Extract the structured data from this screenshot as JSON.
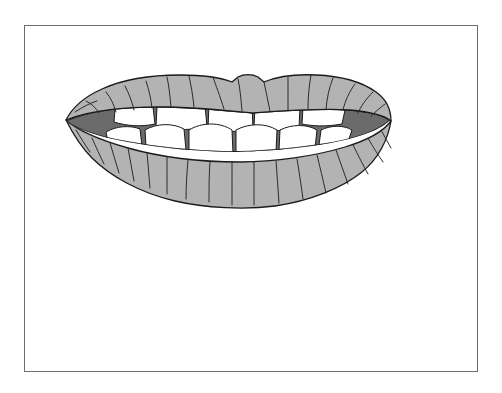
{
  "image": {
    "kind": "line-art-illustration",
    "subject": "lips-open-mouth-with-teeth",
    "alt_text": "Grayscale line drawing of a pair of parted lips showing upper and lower teeth",
    "canvas": {
      "width": 502,
      "height": 393
    },
    "background_color": "#ffffff"
  },
  "frame": {
    "name": "illustration-border",
    "x": 24,
    "y": 25,
    "width": 454,
    "height": 347,
    "stroke_color": "#6e6e6e",
    "stroke_width": 1,
    "fill_color": "#ffffff"
  },
  "palette": {
    "lip_fill": "#b3b3b3",
    "lip_outline": "#1a1a1a",
    "lip_crease": "#2b2b2b",
    "mouth_interior": "#6b6b6b",
    "tooth_fill": "#ffffff",
    "tooth_outline": "#1a1a1a",
    "paper": "#ffffff"
  },
  "drawing": {
    "name": "lips-drawing",
    "bounds": {
      "x": 65,
      "y": 74,
      "width": 326,
      "height": 136
    },
    "parts": [
      {
        "name": "upper-lip",
        "label": "Upper lip",
        "fill": "#b3b3b3"
      },
      {
        "name": "lower-lip",
        "label": "Lower lip",
        "fill": "#b3b3b3"
      },
      {
        "name": "mouth-interior",
        "label": "Mouth interior",
        "fill": "#6b6b6b"
      },
      {
        "name": "upper-teeth",
        "label": "Upper teeth",
        "fill": "#ffffff",
        "count": 4
      },
      {
        "name": "lower-teeth",
        "label": "Lower teeth",
        "fill": "#ffffff",
        "count": 6
      },
      {
        "name": "upper-lip-creases",
        "label": "Upper lip creases",
        "count": 13
      },
      {
        "name": "lower-lip-creases",
        "label": "Lower lip creases",
        "count": 17
      },
      {
        "name": "cupids-bow",
        "label": "Cupid's bow notch"
      }
    ]
  }
}
